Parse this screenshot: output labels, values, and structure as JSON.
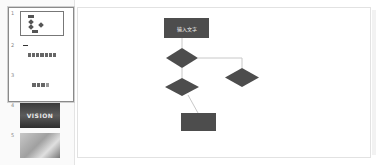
{
  "thumbnail_panel": {
    "slides": [
      {
        "number": "1",
        "type": "flowchart",
        "selected": true
      },
      {
        "number": "2",
        "type": "icon-row",
        "selected": false
      },
      {
        "number": "3",
        "type": "icon-row-small",
        "selected": false
      },
      {
        "number": "4",
        "type": "image",
        "caption": "VISION",
        "selected": false
      },
      {
        "number": "5",
        "type": "image-photo",
        "selected": false
      }
    ]
  },
  "slide": {
    "flowchart": {
      "start_box": {
        "label": "输入文字"
      },
      "decision_1": {
        "label": ""
      },
      "decision_2": {
        "label": ""
      },
      "decision_3": {
        "label": ""
      },
      "end_box": {
        "label": ""
      }
    },
    "colors": {
      "shape_fill": "#4d4d4d",
      "connector": "#c8c8c8",
      "text": "#f0f0f0"
    }
  }
}
